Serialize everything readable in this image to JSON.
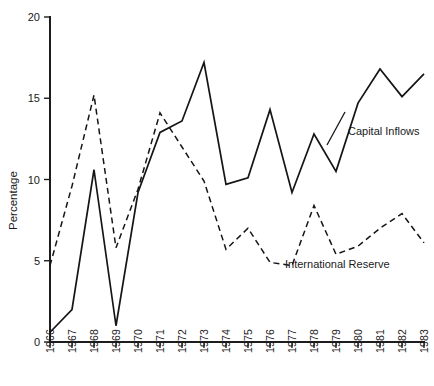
{
  "chart_data": {
    "type": "line",
    "title": "",
    "subtitle": "",
    "xlabel": "",
    "ylabel": "Percentage",
    "ylim": [
      0,
      20
    ],
    "xlim": [
      1966,
      1983
    ],
    "yticks": [
      "0",
      "5",
      "10",
      "15",
      "20"
    ],
    "ytick_values": [
      0,
      5,
      10,
      15,
      20
    ],
    "grid": false,
    "legend_position": "inline-annotation",
    "categories": [
      "1966",
      "1967",
      "1968",
      "1969",
      "1970",
      "1971",
      "1972",
      "1973",
      "1974",
      "1975",
      "1976",
      "1977",
      "1978",
      "1979",
      "1980",
      "1981",
      "1982",
      "1983"
    ],
    "x": [
      1966,
      1967,
      1968,
      1969,
      1970,
      1971,
      1972,
      1973,
      1974,
      1975,
      1976,
      1977,
      1978,
      1979,
      1980,
      1981,
      1982,
      1983
    ],
    "series": [
      {
        "name": "Capital Inflows",
        "style": "solid",
        "color": "#151515",
        "values": [
          0.6,
          2.0,
          10.6,
          1.0,
          9.2,
          12.9,
          13.6,
          17.2,
          9.7,
          10.1,
          14.3,
          9.2,
          12.8,
          10.5,
          14.7,
          16.8,
          15.1,
          16.5
        ]
      },
      {
        "name": "International Reserve",
        "style": "dashed",
        "color": "#151515",
        "values": [
          4.7,
          9.6,
          15.2,
          5.8,
          9.4,
          14.1,
          12.0,
          9.9,
          5.7,
          7.0,
          4.9,
          4.7,
          8.4,
          5.4,
          5.9,
          7.0,
          7.9,
          6.1
        ]
      }
    ],
    "annotations": [
      {
        "text": "Capital Inflows",
        "series": "Capital Inflows"
      },
      {
        "text": "International Reserve",
        "series": "International Reserve"
      }
    ]
  }
}
